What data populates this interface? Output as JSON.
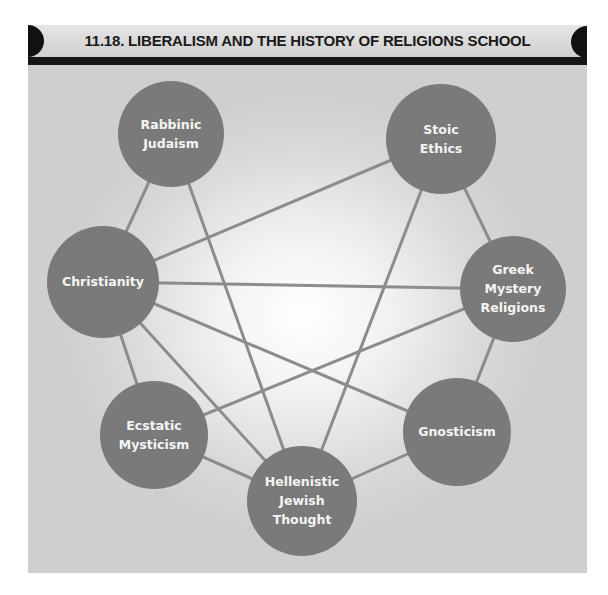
{
  "figure": {
    "title": "11.18. LIBERALISM AND THE HISTORY OF RELIGIONS SCHOOL"
  },
  "colors": {
    "node_fill": "#7a7a7a",
    "edge": "#8c8c8c",
    "header_bar": "#151515",
    "label": "#f4f4f4"
  },
  "nodes": [
    {
      "id": "rabbinic",
      "lines": [
        "Rabbinic",
        "Judaism"
      ],
      "cx": 171,
      "cy": 134,
      "r": 53
    },
    {
      "id": "stoic",
      "lines": [
        "Stoic",
        "Ethics"
      ],
      "cx": 441,
      "cy": 139,
      "r": 55
    },
    {
      "id": "christianity",
      "lines": [
        "Christianity"
      ],
      "cx": 103,
      "cy": 282,
      "r": 56
    },
    {
      "id": "greek",
      "lines": [
        "Greek",
        "Mystery",
        "Religions"
      ],
      "cx": 513,
      "cy": 289,
      "r": 53
    },
    {
      "id": "ecstatic",
      "lines": [
        "Ecstatic",
        "Mysticism"
      ],
      "cx": 154,
      "cy": 435,
      "r": 54
    },
    {
      "id": "gnosticism",
      "lines": [
        "Gnosticism"
      ],
      "cx": 457,
      "cy": 432,
      "r": 54
    },
    {
      "id": "hellenistic",
      "lines": [
        "Hellenistic",
        "Jewish",
        "Thought"
      ],
      "cx": 302,
      "cy": 501,
      "r": 55
    }
  ],
  "edges": [
    [
      "rabbinic",
      "christianity"
    ],
    [
      "rabbinic",
      "hellenistic"
    ],
    [
      "stoic",
      "christianity"
    ],
    [
      "stoic",
      "greek"
    ],
    [
      "stoic",
      "hellenistic"
    ],
    [
      "christianity",
      "greek"
    ],
    [
      "christianity",
      "gnosticism"
    ],
    [
      "christianity",
      "hellenistic"
    ],
    [
      "christianity",
      "ecstatic"
    ],
    [
      "greek",
      "ecstatic"
    ],
    [
      "greek",
      "gnosticism"
    ],
    [
      "ecstatic",
      "hellenistic"
    ],
    [
      "gnosticism",
      "hellenistic"
    ]
  ]
}
